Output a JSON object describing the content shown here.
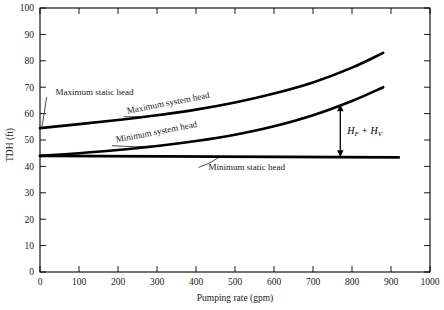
{
  "chart_data": {
    "type": "line",
    "title": "",
    "xlabel": "Pumping rate (gpm)",
    "ylabel": "TDH (ft)",
    "xlim": [
      0,
      1000
    ],
    "ylim": [
      0,
      100
    ],
    "xticks": [
      0,
      100,
      200,
      300,
      400,
      500,
      600,
      700,
      800,
      900,
      1000
    ],
    "yticks": [
      0,
      10,
      20,
      30,
      40,
      50,
      60,
      70,
      80,
      90,
      100
    ],
    "xtick_labels": [
      "0",
      "100",
      "200",
      "300",
      "400",
      "500",
      "600",
      "700",
      "800",
      "900",
      "1000"
    ],
    "ytick_labels": [
      "0",
      "10",
      "20",
      "30",
      "40",
      "50",
      "60",
      "70",
      "80",
      "90",
      "100"
    ],
    "grid": false,
    "legend": "none",
    "series": [
      {
        "name": "Maximum system head",
        "x": [
          0,
          100,
          200,
          300,
          400,
          500,
          600,
          700,
          800,
          880
        ],
        "values": [
          54.5,
          56.0,
          57.6,
          59.4,
          61.5,
          64.2,
          67.6,
          71.8,
          77.4,
          83.0
        ]
      },
      {
        "name": "Minimum system head",
        "x": [
          0,
          100,
          200,
          300,
          400,
          500,
          600,
          700,
          800,
          880
        ],
        "values": [
          44.0,
          45.0,
          46.2,
          47.7,
          49.6,
          52.0,
          55.2,
          59.4,
          64.8,
          70.0
        ]
      },
      {
        "name": "Minimum static head",
        "x": [
          0,
          920
        ],
        "values": [
          44.0,
          43.4
        ]
      },
      {
        "name": "Maximum static head",
        "x": [
          0
        ],
        "values": [
          54.5
        ]
      }
    ],
    "annotations": [
      {
        "id": "max-static-head",
        "text": "Maximum static head",
        "x": 140,
        "y": 67,
        "rotation": 0,
        "leader_to_x": 5,
        "leader_to_y": 55
      },
      {
        "id": "max-system-head",
        "text": "Maximum system head",
        "x": 330,
        "y": 63,
        "rotation": -11,
        "leader_to_x": 320,
        "leader_to_y": 59.5
      },
      {
        "id": "min-system-head",
        "text": "Minimum system head",
        "x": 300,
        "y": 52,
        "rotation": -11,
        "leader_to_x": 300,
        "leader_to_y": 47.8
      },
      {
        "id": "min-static-head",
        "text": "Minimum static head",
        "x": 530,
        "y": 38.5,
        "rotation": 0,
        "leader_to_x": 460,
        "leader_to_y": 43.5
      },
      {
        "id": "head-loss-arrow",
        "text_main": "H",
        "text_sub1": "F",
        "text_plus": " + ",
        "text_main2": "H",
        "text_sub2": "V",
        "full_text": "HF + HV",
        "x": 770,
        "y_top": 63.5,
        "y_bottom": 43.5
      }
    ],
    "colors": {
      "curve": "#000000",
      "axis": "#000000",
      "background": "#ffffff"
    }
  }
}
